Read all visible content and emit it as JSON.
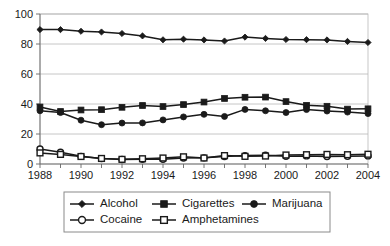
{
  "chart_data": {
    "type": "line",
    "title": "",
    "subtitle": "",
    "xlabel": "",
    "ylabel": "",
    "xlim": [
      1988,
      2004
    ],
    "ylim": [
      0,
      100
    ],
    "yticks": [
      0,
      20,
      40,
      60,
      80,
      100
    ],
    "ytick_labels": [
      "0",
      "20",
      "40",
      "60",
      "80",
      "100"
    ],
    "x": [
      1988,
      1989,
      1990,
      1991,
      1992,
      1993,
      1994,
      1995,
      1996,
      1997,
      1998,
      1999,
      2000,
      2001,
      2002,
      2003,
      2004
    ],
    "xtick_labels_shown": [
      "1988",
      "",
      "1990",
      "",
      "1992",
      "",
      "1994",
      "",
      "1996",
      "",
      "1998",
      "",
      "2000",
      "",
      "2002",
      "",
      "2004"
    ],
    "xticks_labeled": [
      1988,
      1990,
      1992,
      1994,
      1996,
      1998,
      2000,
      2002,
      2004
    ],
    "grid": "horizontal",
    "legend_position": "bottom",
    "series": [
      {
        "name": "Alcohol",
        "marker": "filled-diamond",
        "values": [
          89.6,
          89.6,
          88.5,
          88.0,
          87.0,
          85.4,
          82.8,
          83.2,
          82.7,
          82.0,
          84.6,
          83.7,
          83.0,
          82.9,
          82.7,
          81.7,
          81.0
        ]
      },
      {
        "name": "Cigarettes",
        "marker": "filled-square",
        "values": [
          38.0,
          35.0,
          36.0,
          36.2,
          37.8,
          39.0,
          38.3,
          39.6,
          41.3,
          43.7,
          44.5,
          44.6,
          41.6,
          39.1,
          38.5,
          36.6,
          36.8
        ]
      },
      {
        "name": "Marijuana",
        "marker": "filled-circle",
        "values": [
          35.5,
          34.3,
          29.2,
          26.2,
          27.3,
          27.4,
          29.4,
          31.4,
          33.1,
          31.7,
          36.4,
          35.5,
          34.3,
          36.3,
          35.3,
          34.6,
          33.6
        ]
      },
      {
        "name": "Cocaine",
        "marker": "open-circle",
        "values": [
          10.0,
          7.8,
          5.1,
          3.6,
          3.0,
          3.1,
          3.1,
          4.0,
          4.1,
          5.0,
          5.6,
          5.8,
          5.2,
          5.4,
          5.0,
          5.1,
          5.4
        ]
      },
      {
        "name": "Amphetamines",
        "marker": "open-square",
        "values": [
          7.4,
          6.4,
          5.0,
          3.7,
          3.1,
          3.5,
          4.0,
          4.8,
          4.0,
          5.6,
          5.1,
          5.3,
          6.0,
          6.2,
          6.4,
          6.2,
          6.5
        ]
      }
    ]
  },
  "axes": {
    "y_labels": [
      "100",
      "80",
      "60",
      "40",
      "20",
      "0"
    ],
    "x_labels": [
      "1988",
      "1990",
      "1992",
      "1994",
      "1996",
      "1998",
      "2000",
      "2002",
      "2004"
    ]
  },
  "legend": {
    "entries": [
      {
        "label": "Alcohol",
        "marker": "filled-diamond"
      },
      {
        "label": "Cigarettes",
        "marker": "filled-square"
      },
      {
        "label": "Marijuana",
        "marker": "filled-circle"
      },
      {
        "label": "Cocaine",
        "marker": "open-circle"
      },
      {
        "label": "Amphetamines",
        "marker": "open-square"
      }
    ]
  },
  "colors": {
    "ink": "#1a1a1a",
    "grid": "#b8b8b8",
    "axis": "#666666",
    "background": "#ffffff"
  }
}
